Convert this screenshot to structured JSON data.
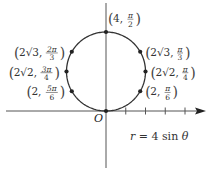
{
  "chart_data": {
    "type": "line",
    "title": "",
    "equation": "r = 4 sin θ",
    "origin_label": "O",
    "curve": {
      "kind": "polar",
      "r_of_theta": "4*sin(theta)",
      "theta_range": [
        0,
        3.14159
      ]
    },
    "x_axis": {
      "ticks_at": [
        1,
        2,
        3,
        4
      ],
      "range": [
        -5,
        5
      ],
      "arrow": true
    },
    "y_axis": {
      "range": [
        -3,
        5.5
      ]
    },
    "points": [
      {
        "label_lead": "4,",
        "frac_num": "π",
        "frac_den": "2",
        "r": 4,
        "theta_deg": 90,
        "side": "right-top"
      },
      {
        "label_lead": "2√3,",
        "frac_num": "π",
        "frac_den": "3",
        "r": 3.4641,
        "theta_deg": 60,
        "side": "right"
      },
      {
        "label_lead": "2√2,",
        "frac_num": "π",
        "frac_den": "4",
        "r": 2.8284,
        "theta_deg": 45,
        "side": "right"
      },
      {
        "label_lead": "2,",
        "frac_num": "π",
        "frac_den": "6",
        "r": 2,
        "theta_deg": 30,
        "side": "right"
      },
      {
        "label_lead": "2√3,",
        "frac_num": "2π",
        "frac_den": "3",
        "r": 3.4641,
        "theta_deg": 120,
        "side": "left"
      },
      {
        "label_lead": "2√2,",
        "frac_num": "3π",
        "frac_den": "4",
        "r": 2.8284,
        "theta_deg": 135,
        "side": "left"
      },
      {
        "label_lead": "2,",
        "frac_num": "5π",
        "frac_den": "6",
        "r": 2,
        "theta_deg": 150,
        "side": "left"
      },
      {
        "label_lead": "",
        "frac_num": "",
        "frac_den": "",
        "r": 0,
        "theta_deg": 0,
        "side": "none"
      }
    ]
  }
}
